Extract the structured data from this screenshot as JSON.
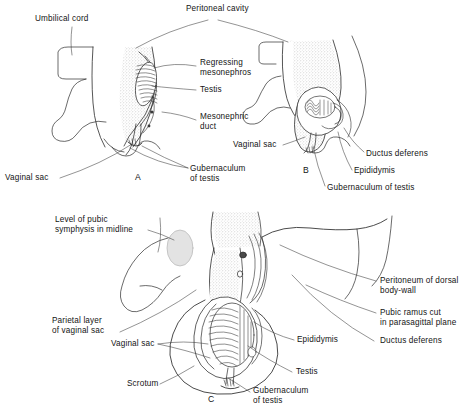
{
  "figure": {
    "panels": [
      {
        "id": "A",
        "letter": "A"
      },
      {
        "id": "B",
        "letter": "B"
      },
      {
        "id": "C",
        "letter": "C"
      }
    ]
  },
  "labels": {
    "peritoneal_cavity": "Peritoneal cavity",
    "umbilical_cord": "Umbilical cord",
    "regressing_mesonephros": "Regressing\nmesonephros",
    "testis_a": "Testis",
    "mesonephric_duct": "Mesonephric\nduct",
    "vaginal_sac_a": "Vaginal sac",
    "vaginal_sac_left": "Vaginal sac",
    "gubernaculum_of_testis_a": "Gubernaculum\nof testis",
    "ductus_deferens_b": "Ductus deferens",
    "epididymis_b": "Epididymis",
    "gubernaculum_of_testis_b": "Gubernaculum of testis",
    "level_of_pubic_symphysis": "Level of pubic\nsymphysis in midline",
    "parietal_layer_of_vaginal_sac": "Parietal layer\nof vaginal sac",
    "vaginal_sac_c": "Vaginal sac",
    "scrotum": "Scrotum",
    "peritoneum_of_dorsal_body_wall": "Peritoneum of dorsal\nbody-wall",
    "pubic_ramus_cut": "Pubic ramus cut\nin parasagittal plane",
    "ductus_deferens_c": "Ductus deferens",
    "epididymis_c": "Epididymis",
    "testis_c": "Testis",
    "gubernaculum_of_testis_c": "Gubernaculum\nof testis"
  },
  "colors": {
    "ink": "#141414",
    "line": "#2b2b2b",
    "stipple": "#9a9a9a",
    "paper": "#ffffff",
    "pale_fill": "#e8e8e8"
  }
}
